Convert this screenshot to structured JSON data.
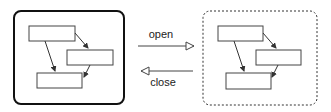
{
  "diagram": {
    "left_panel": {
      "name": "closed-state",
      "border": "solid",
      "boxes": 3
    },
    "right_panel": {
      "name": "open-state",
      "border": "dashed",
      "boxes": 3
    },
    "transitions": [
      {
        "label": "open",
        "direction": "left-to-right"
      },
      {
        "label": "close",
        "direction": "right-to-left"
      }
    ]
  },
  "colors": {
    "stroke": "#333333",
    "background": "#ffffff"
  }
}
